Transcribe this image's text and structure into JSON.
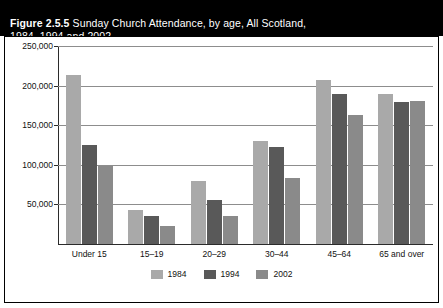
{
  "figure": {
    "number": "Figure 2.5.5",
    "caption": "Sunday Church Attendance, by age, All Scotland,\n1984, 1994 and 2002"
  },
  "chart_data": {
    "type": "bar",
    "title": "Sunday Church Attendance, by age, All Scotland, 1984, 1994 and 2002",
    "xlabel": "",
    "ylabel": "",
    "ylim": [
      0,
      250000
    ],
    "yticks": [
      0,
      50000,
      100000,
      150000,
      200000,
      250000
    ],
    "ytick_labels": [
      "",
      "50,000",
      "100,000",
      "150,000",
      "200,000",
      "250,000"
    ],
    "grid": true,
    "legend_position": "bottom-center",
    "categories": [
      "Under 15",
      "15–19",
      "20–29",
      "30–44",
      "45–64",
      "65 and over"
    ],
    "series": [
      {
        "name": "1984",
        "color": "#a9a9a9",
        "values": [
          214000,
          43000,
          79000,
          130000,
          207000,
          189000
        ]
      },
      {
        "name": "1994",
        "color": "#595959",
        "values": [
          125000,
          35000,
          55000,
          122000,
          189000,
          179000
        ]
      },
      {
        "name": "2002",
        "color": "#8a8a8a",
        "values": [
          98000,
          23000,
          35000,
          83000,
          163000,
          180000
        ]
      }
    ]
  },
  "colors": {
    "band_background": "#000000",
    "band_text": "#ffffff",
    "panel_background": "#ffffff",
    "axis": "#2b2b2b",
    "gridline": "#8d8d8d"
  }
}
